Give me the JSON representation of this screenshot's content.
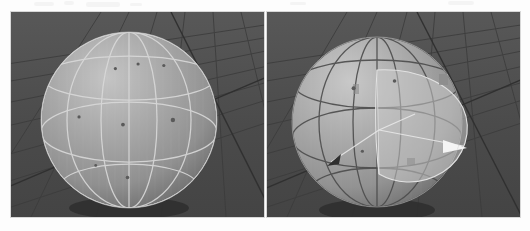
{
  "page": {
    "background_color": "#fdfdfd",
    "width": 530,
    "height": 231,
    "title": ""
  },
  "figure": {
    "kind": "3d-viewport-pair",
    "panel_count": 2,
    "panel_background_color": "#4c4c4c",
    "floor_color": "#4a4a4a",
    "floor_line_color": "#3a3a3a",
    "sphere_color": "#9d9d9d",
    "sphere_highlight_color": "#b9b9b9",
    "sphere_shadow_color": "#6f6f6f",
    "contact_shadow_color": "#2c2c2c"
  },
  "panels": [
    {
      "id": "panel-left",
      "name": "left-viewport",
      "label": "",
      "sphere": {
        "grid_line_color": "#d6d6d6",
        "grid_line_style": "light",
        "meridian_count": 5,
        "parallel_count": 3,
        "marker_color": "#5a5a5a",
        "marker_count": 8,
        "markers": [
          {
            "x": 41,
            "y": 16,
            "r": 1.6
          },
          {
            "x": 56,
            "y": 13,
            "r": 1.6
          },
          {
            "x": 73,
            "y": 14,
            "r": 1.6
          },
          {
            "x": 17,
            "y": 48,
            "r": 1.6
          },
          {
            "x": 46,
            "y": 53,
            "r": 1.9
          },
          {
            "x": 79,
            "y": 50,
            "r": 2.2
          },
          {
            "x": 49,
            "y": 88,
            "r": 1.8
          },
          {
            "x": 28,
            "y": 80,
            "r": 1.4
          }
        ]
      },
      "overlays": []
    },
    {
      "id": "panel-right",
      "name": "right-viewport",
      "label": "",
      "sphere": {
        "grid_line_color": "#4a4a4a",
        "grid_line_style": "dark",
        "meridian_count": 5,
        "parallel_count": 3,
        "marker_color": "#5a5a5a",
        "marker_count": 3,
        "markers": [
          {
            "x": 34,
            "y": 27,
            "r": 2.0
          },
          {
            "x": 62,
            "y": 22,
            "r": 1.8
          },
          {
            "x": 40,
            "y": 70,
            "r": 1.6
          }
        ]
      },
      "overlays": [
        {
          "name": "translucent-wedge-patch",
          "fill": "#c9c9c9",
          "opacity": 0.55,
          "stroke": "#e4e4e4"
        },
        {
          "name": "white-direction-arrow",
          "color": "#f2f2f2",
          "points_to": "right"
        },
        {
          "name": "dark-direction-arrow",
          "color": "#333333",
          "points_to": "left"
        },
        {
          "name": "radius-line-1",
          "color": "#e8e8e8"
        },
        {
          "name": "radius-line-2",
          "color": "#e8e8e8"
        },
        {
          "name": "patch-corner-tab-1",
          "color": "#8d8d8d"
        },
        {
          "name": "patch-corner-tab-2",
          "color": "#8d8d8d"
        }
      ]
    }
  ],
  "artifacts": {
    "top_smudges": [
      {
        "x": 34,
        "y": 2,
        "w": 20,
        "h": 4
      },
      {
        "x": 64,
        "y": 1,
        "w": 10,
        "h": 4
      },
      {
        "x": 86,
        "y": 2,
        "w": 34,
        "h": 5
      },
      {
        "x": 130,
        "y": 3,
        "w": 12,
        "h": 3
      },
      {
        "x": 290,
        "y": 2,
        "w": 16,
        "h": 3
      },
      {
        "x": 448,
        "y": 1,
        "w": 26,
        "h": 4
      }
    ]
  }
}
